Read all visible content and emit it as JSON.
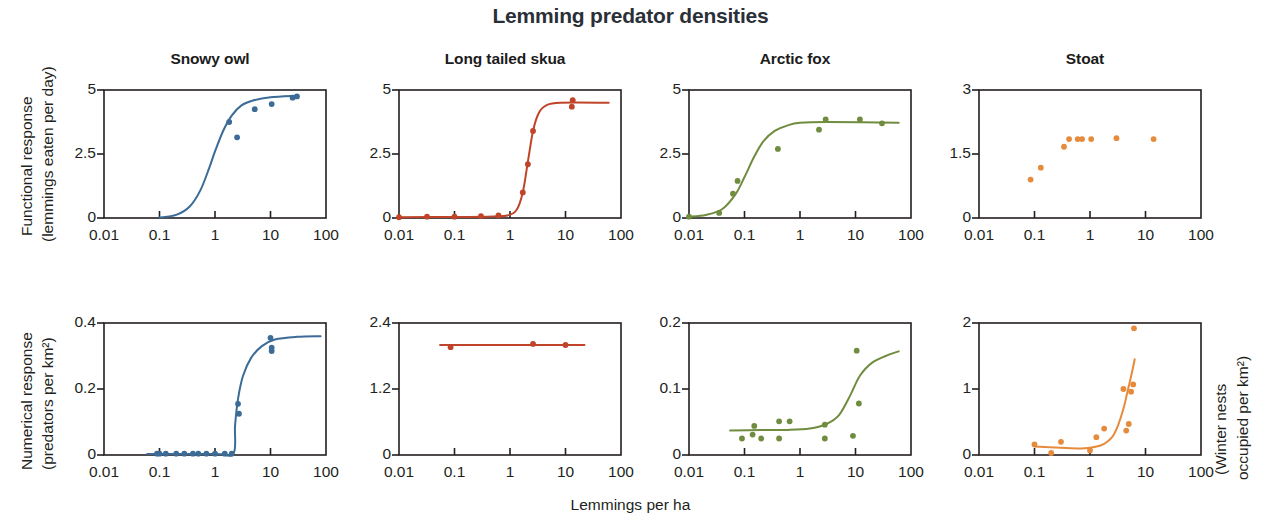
{
  "title": "Lemming predator densities",
  "axes": {
    "x_label": "Lemmings per ha",
    "y_label_top_line1": "Functional response",
    "y_label_top_line2": "(lemmings eaten per day)",
    "y_label_bottom_line1": "Numerical response",
    "y_label_bottom_line2": "(predators per km²)",
    "y_label_right_line1": "(Winter nests",
    "y_label_right_line2": "occupied per km²)",
    "x_ticks": [
      "0.01",
      "0.1",
      "1",
      "10",
      "100"
    ]
  },
  "colors": {
    "snowy_owl": "#3b6b96",
    "long_tailed_skua": "#c0442a",
    "arctic_fox": "#6f8c3f",
    "stoat": "#e68a3c",
    "axis": "#231f20",
    "title": "#2b3038"
  },
  "panel_titles": [
    "Snowy owl",
    "Long tailed skua",
    "Arctic fox",
    "Stoat"
  ],
  "chart_data": [
    {
      "type": "scatter",
      "title": "Snowy owl",
      "row": "Functional response",
      "xlabel": "Lemmings per ha",
      "ylabel": "Functional response (lemmings eaten per day)",
      "xscale": "log",
      "xlim": [
        0.01,
        100
      ],
      "ylim": [
        0,
        5
      ],
      "x_ticks": [
        "0.01",
        "0.1",
        "1",
        "10",
        "100"
      ],
      "y_ticks": [
        "0",
        "2.5",
        "5"
      ],
      "color": "#3b6b96",
      "points": [
        {
          "x": 1.8,
          "y": 3.75
        },
        {
          "x": 2.5,
          "y": 3.15
        },
        {
          "x": 5.2,
          "y": 4.25
        },
        {
          "x": 10.5,
          "y": 4.45
        },
        {
          "x": 25.0,
          "y": 4.7
        },
        {
          "x": 30.0,
          "y": 4.75
        }
      ],
      "fit": {
        "kind": "sigmoid",
        "description": "Type III functional response rising from 0 near x=0.1 to asymptote ~4.8",
        "asymptote": 4.8,
        "half_saturation": 1.0,
        "curve": [
          {
            "x": 0.1,
            "y": 0.02
          },
          {
            "x": 0.2,
            "y": 0.12
          },
          {
            "x": 0.35,
            "y": 0.45
          },
          {
            "x": 0.55,
            "y": 1.1
          },
          {
            "x": 0.8,
            "y": 2.0
          },
          {
            "x": 1.0,
            "y": 2.6
          },
          {
            "x": 1.4,
            "y": 3.4
          },
          {
            "x": 2.0,
            "y": 4.0
          },
          {
            "x": 3.0,
            "y": 4.4
          },
          {
            "x": 5.0,
            "y": 4.6
          },
          {
            "x": 10.0,
            "y": 4.72
          },
          {
            "x": 30.0,
            "y": 4.78
          }
        ]
      }
    },
    {
      "type": "scatter",
      "title": "Long tailed skua",
      "row": "Functional response",
      "xlabel": "Lemmings per ha",
      "ylabel": "Functional response (lemmings eaten per day)",
      "xscale": "log",
      "xlim": [
        0.01,
        100
      ],
      "ylim": [
        0,
        5
      ],
      "x_ticks": [
        "0.01",
        "0.1",
        "1",
        "10",
        "100"
      ],
      "y_ticks": [
        "0",
        "2.5",
        "5"
      ],
      "color": "#c0442a",
      "points": [
        {
          "x": 0.01,
          "y": 0.03
        },
        {
          "x": 0.032,
          "y": 0.05
        },
        {
          "x": 0.1,
          "y": 0.05
        },
        {
          "x": 0.3,
          "y": 0.07
        },
        {
          "x": 0.62,
          "y": 0.1
        },
        {
          "x": 1.7,
          "y": 1.0
        },
        {
          "x": 2.1,
          "y": 2.1
        },
        {
          "x": 2.6,
          "y": 3.4
        },
        {
          "x": 13.0,
          "y": 4.35
        },
        {
          "x": 13.5,
          "y": 4.6
        }
      ],
      "fit": {
        "kind": "sigmoid",
        "description": "Steep Type III response, threshold near x=1.5, asymptote ~4.5",
        "asymptote": 4.5,
        "half_saturation": 2.1,
        "curve": [
          {
            "x": 0.01,
            "y": 0.03
          },
          {
            "x": 0.1,
            "y": 0.04
          },
          {
            "x": 0.5,
            "y": 0.06
          },
          {
            "x": 0.9,
            "y": 0.1
          },
          {
            "x": 1.3,
            "y": 0.3
          },
          {
            "x": 1.7,
            "y": 1.0
          },
          {
            "x": 2.1,
            "y": 2.2
          },
          {
            "x": 2.6,
            "y": 3.4
          },
          {
            "x": 3.3,
            "y": 4.1
          },
          {
            "x": 4.5,
            "y": 4.4
          },
          {
            "x": 8.0,
            "y": 4.5
          },
          {
            "x": 60.0,
            "y": 4.5
          }
        ]
      }
    },
    {
      "type": "scatter",
      "title": "Arctic fox",
      "row": "Functional response",
      "xlabel": "Lemmings per ha",
      "ylabel": "Functional response (lemmings eaten per day)",
      "xscale": "log",
      "xlim": [
        0.01,
        100
      ],
      "ylim": [
        0,
        5
      ],
      "x_ticks": [
        "0.01",
        "0.1",
        "1",
        "10",
        "100"
      ],
      "y_ticks": [
        "0",
        "2.5",
        "5"
      ],
      "color": "#6f8c3f",
      "points": [
        {
          "x": 0.01,
          "y": 0.05
        },
        {
          "x": 0.035,
          "y": 0.2
        },
        {
          "x": 0.062,
          "y": 0.95
        },
        {
          "x": 0.075,
          "y": 1.45
        },
        {
          "x": 0.4,
          "y": 2.7
        },
        {
          "x": 2.2,
          "y": 3.45
        },
        {
          "x": 2.9,
          "y": 3.85
        },
        {
          "x": 12.0,
          "y": 3.85
        },
        {
          "x": 30.0,
          "y": 3.7
        }
      ],
      "fit": {
        "kind": "sigmoid",
        "description": "Type III response saturating near 3.75 above x=1",
        "asymptote": 3.75,
        "half_saturation": 0.16,
        "curve": [
          {
            "x": 0.01,
            "y": 0.05
          },
          {
            "x": 0.02,
            "y": 0.12
          },
          {
            "x": 0.04,
            "y": 0.35
          },
          {
            "x": 0.07,
            "y": 0.95
          },
          {
            "x": 0.1,
            "y": 1.6
          },
          {
            "x": 0.15,
            "y": 2.4
          },
          {
            "x": 0.22,
            "y": 3.0
          },
          {
            "x": 0.35,
            "y": 3.4
          },
          {
            "x": 0.6,
            "y": 3.62
          },
          {
            "x": 1.0,
            "y": 3.72
          },
          {
            "x": 3.0,
            "y": 3.75
          },
          {
            "x": 60.0,
            "y": 3.72
          }
        ]
      }
    },
    {
      "type": "scatter",
      "title": "Stoat",
      "row": "Functional response",
      "xlabel": "Lemmings per ha",
      "ylabel": "Functional response (lemmings eaten per day)",
      "xscale": "log",
      "xlim": [
        0.01,
        100
      ],
      "ylim": [
        0,
        3
      ],
      "x_ticks": [
        "0.01",
        "0.1",
        "1",
        "10",
        "100"
      ],
      "y_ticks": [
        "0",
        "1.5",
        "3"
      ],
      "color": "#e68a3c",
      "points": [
        {
          "x": 0.085,
          "y": 0.9
        },
        {
          "x": 0.13,
          "y": 1.18
        },
        {
          "x": 0.34,
          "y": 1.67
        },
        {
          "x": 0.42,
          "y": 1.85
        },
        {
          "x": 0.6,
          "y": 1.85
        },
        {
          "x": 0.72,
          "y": 1.85
        },
        {
          "x": 1.05,
          "y": 1.85
        },
        {
          "x": 3.0,
          "y": 1.87
        },
        {
          "x": 14.0,
          "y": 1.85
        }
      ],
      "fit": null
    },
    {
      "type": "scatter",
      "title": "Snowy owl",
      "row": "Numerical response",
      "xlabel": "Lemmings per ha",
      "ylabel": "Numerical response (predators per km²)",
      "xscale": "log",
      "xlim": [
        0.01,
        100
      ],
      "ylim": [
        0,
        0.4
      ],
      "x_ticks": [
        "0.01",
        "0.1",
        "1",
        "10",
        "100"
      ],
      "y_ticks": [
        "0",
        "0.2",
        "0.4"
      ],
      "color": "#3b6b96",
      "points": [
        {
          "x": 0.09,
          "y": 0.004
        },
        {
          "x": 0.1,
          "y": 0.004
        },
        {
          "x": 0.13,
          "y": 0.004
        },
        {
          "x": 0.2,
          "y": 0.004
        },
        {
          "x": 0.28,
          "y": 0.004
        },
        {
          "x": 0.4,
          "y": 0.004
        },
        {
          "x": 0.5,
          "y": 0.004
        },
        {
          "x": 0.7,
          "y": 0.004
        },
        {
          "x": 1.0,
          "y": 0.004
        },
        {
          "x": 1.5,
          "y": 0.004
        },
        {
          "x": 2.0,
          "y": 0.004
        },
        {
          "x": 2.6,
          "y": 0.155
        },
        {
          "x": 2.7,
          "y": 0.125
        },
        {
          "x": 10.0,
          "y": 0.355
        },
        {
          "x": 10.5,
          "y": 0.325
        },
        {
          "x": 10.5,
          "y": 0.315
        }
      ],
      "fit": {
        "kind": "threshold",
        "description": "Flat at 0 until threshold near x=2.2, then steep rise to asymptote ~0.36",
        "asymptote": 0.36,
        "threshold": 2.2,
        "curve": [
          {
            "x": 0.06,
            "y": 0.003
          },
          {
            "x": 1.0,
            "y": 0.003
          },
          {
            "x": 2.15,
            "y": 0.004
          },
          {
            "x": 2.3,
            "y": 0.09
          },
          {
            "x": 2.6,
            "y": 0.17
          },
          {
            "x": 3.2,
            "y": 0.24
          },
          {
            "x": 4.5,
            "y": 0.295
          },
          {
            "x": 7.0,
            "y": 0.33
          },
          {
            "x": 12.0,
            "y": 0.35
          },
          {
            "x": 30.0,
            "y": 0.358
          },
          {
            "x": 80.0,
            "y": 0.36
          }
        ]
      }
    },
    {
      "type": "scatter",
      "title": "Long tailed skua",
      "row": "Numerical response",
      "xlabel": "Lemmings per ha",
      "ylabel": "Numerical response (predators per km²)",
      "xscale": "log",
      "xlim": [
        0.01,
        100
      ],
      "ylim": [
        0,
        2.4
      ],
      "x_ticks": [
        "0.01",
        "0.1",
        "1",
        "10",
        "100"
      ],
      "y_ticks": [
        "0",
        "1.2",
        "2.4"
      ],
      "color": "#c0442a",
      "points": [
        {
          "x": 0.085,
          "y": 1.96
        },
        {
          "x": 2.6,
          "y": 2.02
        },
        {
          "x": 10.0,
          "y": 2.0
        }
      ],
      "fit": {
        "kind": "constant",
        "description": "Flat line at ~2.0 across observed range",
        "level": 2.0,
        "curve": [
          {
            "x": 0.055,
            "y": 2.0
          },
          {
            "x": 22.0,
            "y": 2.0
          }
        ]
      }
    },
    {
      "type": "scatter",
      "title": "Arctic fox",
      "row": "Numerical response",
      "xlabel": "Lemmings per ha",
      "ylabel": "Numerical response (predators per km²)",
      "xscale": "log",
      "xlim": [
        0.01,
        100
      ],
      "ylim": [
        0,
        0.2
      ],
      "x_ticks": [
        "0.01",
        "0.1",
        "1",
        "10",
        "100"
      ],
      "y_ticks": [
        "0",
        "0.1",
        "0.2"
      ],
      "color": "#6f8c3f",
      "points": [
        {
          "x": 0.09,
          "y": 0.025
        },
        {
          "x": 0.14,
          "y": 0.031
        },
        {
          "x": 0.15,
          "y": 0.044
        },
        {
          "x": 0.2,
          "y": 0.025
        },
        {
          "x": 0.42,
          "y": 0.051
        },
        {
          "x": 0.42,
          "y": 0.025
        },
        {
          "x": 0.65,
          "y": 0.051
        },
        {
          "x": 2.8,
          "y": 0.046
        },
        {
          "x": 2.8,
          "y": 0.025
        },
        {
          "x": 9.0,
          "y": 0.029
        },
        {
          "x": 10.5,
          "y": 0.158
        },
        {
          "x": 11.5,
          "y": 0.078
        }
      ],
      "fit": {
        "kind": "sigmoid",
        "description": "Low plateau ~0.037 rising above x=5 toward ~0.16",
        "curve": [
          {
            "x": 0.055,
            "y": 0.037
          },
          {
            "x": 0.2,
            "y": 0.038
          },
          {
            "x": 0.6,
            "y": 0.038
          },
          {
            "x": 1.5,
            "y": 0.04
          },
          {
            "x": 3.0,
            "y": 0.047
          },
          {
            "x": 5.0,
            "y": 0.06
          },
          {
            "x": 8.0,
            "y": 0.09
          },
          {
            "x": 12.0,
            "y": 0.12
          },
          {
            "x": 20.0,
            "y": 0.14
          },
          {
            "x": 40.0,
            "y": 0.152
          },
          {
            "x": 60.0,
            "y": 0.157
          }
        ]
      }
    },
    {
      "type": "scatter",
      "title": "Stoat",
      "row": "Numerical response",
      "xlabel": "Lemmings per ha",
      "ylabel": "(Winter nests occupied per km²)",
      "xscale": "log",
      "xlim": [
        0.01,
        100
      ],
      "ylim": [
        0,
        2
      ],
      "x_ticks": [
        "0.01",
        "0.1",
        "1",
        "10",
        "100"
      ],
      "y_ticks": [
        "0",
        "1",
        "2"
      ],
      "color": "#e68a3c",
      "points": [
        {
          "x": 0.1,
          "y": 0.16
        },
        {
          "x": 0.2,
          "y": 0.03
        },
        {
          "x": 0.3,
          "y": 0.2
        },
        {
          "x": 1.0,
          "y": 0.07
        },
        {
          "x": 1.3,
          "y": 0.27
        },
        {
          "x": 1.8,
          "y": 0.4
        },
        {
          "x": 4.0,
          "y": 1.0
        },
        {
          "x": 4.5,
          "y": 0.37
        },
        {
          "x": 5.0,
          "y": 0.47
        },
        {
          "x": 5.5,
          "y": 0.96
        },
        {
          "x": 6.0,
          "y": 1.07
        },
        {
          "x": 6.2,
          "y": 1.92
        }
      ],
      "fit": {
        "kind": "exponential",
        "description": "Near-flat at ~0.12 then exponential rise past x=2 to ~1.45",
        "curve": [
          {
            "x": 0.1,
            "y": 0.13
          },
          {
            "x": 0.3,
            "y": 0.11
          },
          {
            "x": 0.7,
            "y": 0.1
          },
          {
            "x": 1.2,
            "y": 0.12
          },
          {
            "x": 1.8,
            "y": 0.17
          },
          {
            "x": 2.5,
            "y": 0.27
          },
          {
            "x": 3.2,
            "y": 0.45
          },
          {
            "x": 4.0,
            "y": 0.7
          },
          {
            "x": 4.8,
            "y": 0.98
          },
          {
            "x": 5.6,
            "y": 1.22
          },
          {
            "x": 6.4,
            "y": 1.45
          }
        ]
      }
    }
  ]
}
